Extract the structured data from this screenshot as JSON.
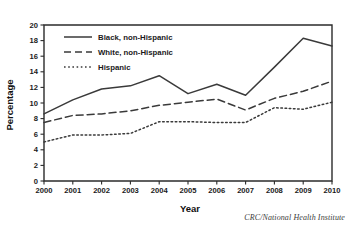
{
  "chart_data": {
    "type": "line",
    "title": "",
    "xlabel": "Year",
    "ylabel": "Percentage",
    "categories": [
      "2000",
      "2001",
      "2002",
      "2003",
      "2004",
      "2005",
      "2006",
      "2007",
      "2008",
      "2009",
      "2010"
    ],
    "x": [
      2000,
      2001,
      2002,
      2003,
      2004,
      2005,
      2006,
      2007,
      2008,
      2009,
      2010
    ],
    "xlim": [
      2000,
      2010
    ],
    "ylim": [
      0,
      20
    ],
    "yticks": [
      0,
      2,
      4,
      6,
      8,
      10,
      12,
      14,
      16,
      18,
      20
    ],
    "grid": false,
    "legend_position": "top-left",
    "series": [
      {
        "name": "Black, non-Hispanic",
        "style": "solid",
        "values": [
          8.6,
          10.4,
          11.8,
          12.2,
          13.5,
          11.2,
          12.4,
          11.0,
          14.6,
          18.3,
          17.3
        ]
      },
      {
        "name": "White, non-Hispanic",
        "style": "dashed",
        "values": [
          7.5,
          8.4,
          8.6,
          9.0,
          9.7,
          10.1,
          10.5,
          9.1,
          10.6,
          11.5,
          12.8
        ]
      },
      {
        "name": "Hispanic",
        "style": "dotted",
        "values": [
          5.0,
          5.9,
          5.9,
          6.1,
          7.6,
          7.6,
          7.5,
          7.5,
          9.4,
          9.2,
          10.1
        ]
      }
    ]
  },
  "axes": {
    "ylabel": "Percentage",
    "xlabel": "Year",
    "ytick_labels": [
      "0",
      "2",
      "4",
      "6",
      "8",
      "10",
      "12",
      "14",
      "16",
      "18",
      "20"
    ],
    "xtick_labels": [
      "2000",
      "2001",
      "2002",
      "2003",
      "2004",
      "2005",
      "2006",
      "2007",
      "2008",
      "2009",
      "2010"
    ]
  },
  "legend": {
    "items": [
      {
        "label": "Black, non-Hispanic",
        "style": "solid"
      },
      {
        "label": "White, non-Hispanic",
        "style": "dashed"
      },
      {
        "label": "Hispanic",
        "style": "dotted"
      }
    ]
  },
  "credit": {
    "text": "CRC/National Health Institute"
  },
  "colors": {
    "line": "#3a3a3a",
    "axis": "#2b2b2b",
    "text": "#1a1a1a",
    "background": "#ffffff"
  }
}
